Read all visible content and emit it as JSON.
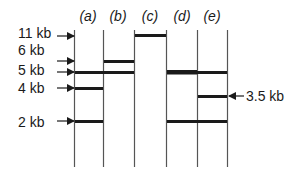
{
  "diagram": {
    "type": "gel-electrophoresis",
    "lanes": [
      {
        "id": "a",
        "label": "(a)"
      },
      {
        "id": "b",
        "label": "(b)"
      },
      {
        "id": "c",
        "label": "(c)"
      },
      {
        "id": "d",
        "label": "(d)"
      },
      {
        "id": "e",
        "label": "(e)"
      }
    ],
    "size_markers_left": [
      {
        "label": "11 kb",
        "size_kb": 11
      },
      {
        "label": "6 kb",
        "size_kb": 6
      },
      {
        "label": "5 kb",
        "size_kb": 5
      },
      {
        "label": "4 kb",
        "size_kb": 4
      },
      {
        "label": "2 kb",
        "size_kb": 2
      }
    ],
    "size_markers_right": [
      {
        "label": "3.5 kb",
        "size_kb": 3.5
      }
    ],
    "bands": [
      {
        "lane": "a",
        "size_kb": 5
      },
      {
        "lane": "a",
        "size_kb": 4
      },
      {
        "lane": "a",
        "size_kb": 2
      },
      {
        "lane": "b",
        "size_kb": 6
      },
      {
        "lane": "b",
        "size_kb": 5
      },
      {
        "lane": "c",
        "size_kb": 11
      },
      {
        "lane": "d",
        "size_kb": 5
      },
      {
        "lane": "d",
        "size_kb": 2
      },
      {
        "lane": "e",
        "size_kb": 5
      },
      {
        "lane": "e",
        "size_kb": 3.5
      },
      {
        "lane": "e",
        "size_kb": 2
      }
    ],
    "colors": {
      "ink": "#1a1a1a",
      "background": "#ffffff",
      "lane_line": "#555555"
    }
  }
}
